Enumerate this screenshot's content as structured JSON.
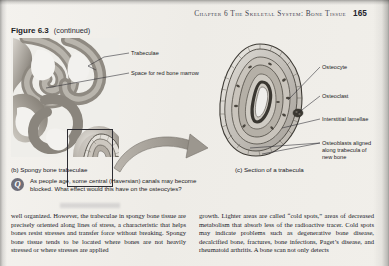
{
  "page": {
    "running_head_text": "Chapter 6   The Skeletal System: Bone Tissue",
    "page_number": "165"
  },
  "figure": {
    "number": "Figure 6.3",
    "continued": "(continued)",
    "labels": {
      "trabeculae": "Trabeculae",
      "marrow_space": "Space for red bone marrow",
      "osteocyte": "Osteocyte",
      "osteoclast": "Osteoclast",
      "interstitial_lamellae": "Interstitial lamellae",
      "osteoblasts": "Osteoblasts aligned\nalong trabecula of\nnew bone"
    },
    "captions": {
      "panel_b": "(b) Spongy bone trabeculae",
      "panel_c": "(c) Section of a trabecula"
    }
  },
  "question": {
    "badge": "Q",
    "text": "As people age, some central (Haversian) canals may become blocked. What effect would this have on the osteocytes?"
  },
  "body": {
    "left_column": "well organized. However, the trabeculae in spongy bone tissue are precisely oriented along lines of stress, a characteristic that helps bones resist stresses and transfer force without breaking. Spongy bone tissue tends to be located where bones are not heavily stressed or where stresses are applied",
    "right_column": "growth. Lighter areas are called “cold spots,” areas of decreased metabolism that absorb less of the radioactive tracer. Cold spots may indicate problems such as degenerative bone disease, decalcified bone, fractures, bone infections, Paget’s disease, and rheumatoid arthritis. A bone scan not only detects"
  },
  "colors": {
    "paper": "#f2f0ec",
    "ink": "#17171f",
    "badge": "#6e6e78",
    "bone_light": "#d9d6d0",
    "bone_mid": "#a9a49c",
    "bone_dark": "#6f6a63"
  }
}
